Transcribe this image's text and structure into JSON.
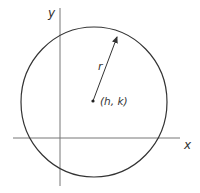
{
  "diagram": {
    "type": "circle-on-cartesian-axes",
    "labels": {
      "y_axis": "y",
      "x_axis": "x",
      "radius": "r",
      "center": "(h, k)"
    },
    "geometry": {
      "y_axis_x": 60,
      "y_axis_range": [
        8,
        186
      ],
      "x_axis_y": 138,
      "x_axis_range": [
        13,
        180
      ],
      "center": [
        93,
        101
      ],
      "radius_x": 73,
      "radius_y": 75,
      "arrow_tip": [
        117,
        35
      ]
    },
    "colors": {
      "stroke": "#333333",
      "axis": "#666666",
      "background": "#ffffff"
    }
  }
}
